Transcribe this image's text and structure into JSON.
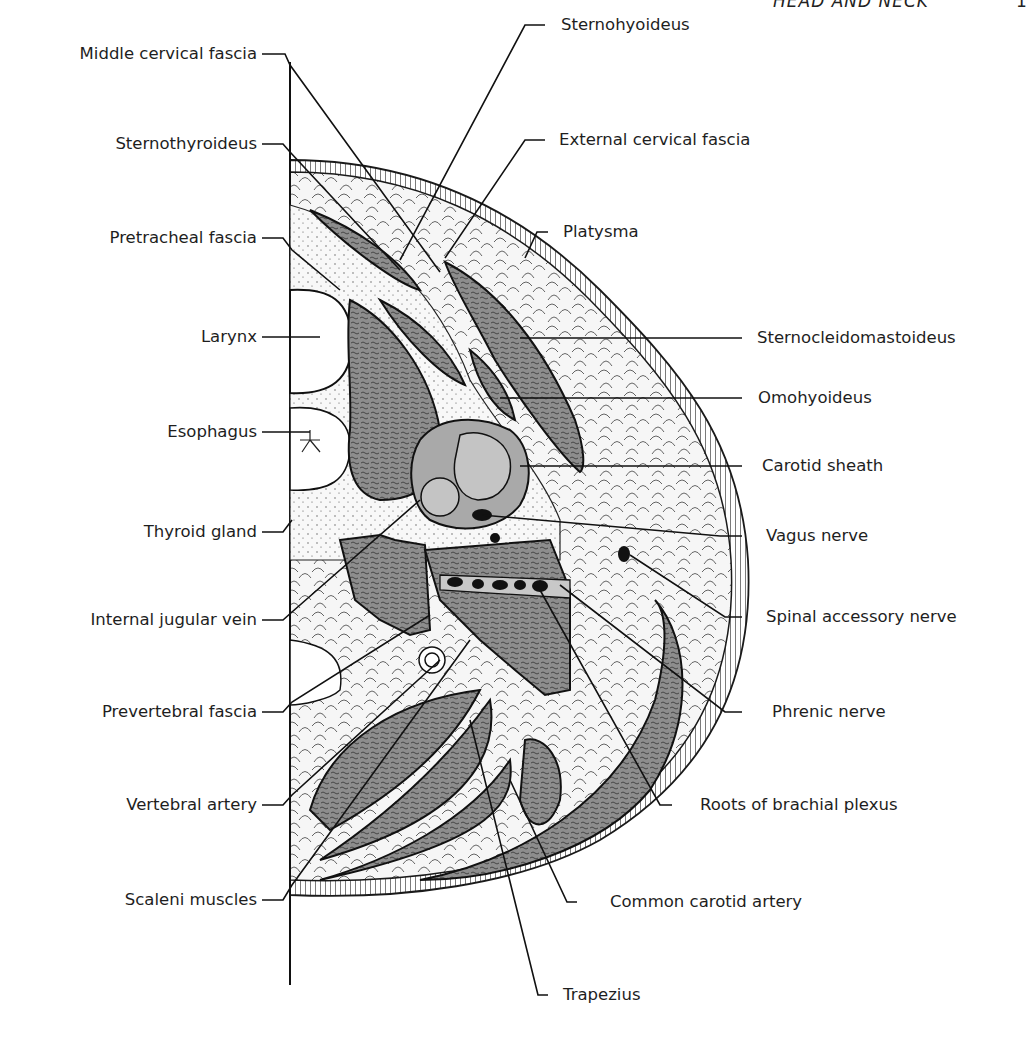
{
  "page": {
    "running_head": "HEAD AND NECK",
    "page_number": "1"
  },
  "figure": {
    "colors": {
      "muscle_fill": "#8d8d8d",
      "vessel_fill": "#a9a9a9",
      "fat_fill": "#f4f4f4",
      "skin_hatch": "#333333",
      "line": "#1a1a1a"
    },
    "labels_left": [
      {
        "id": "middle-cervical-fascia",
        "text": "Middle cervical fascia"
      },
      {
        "id": "sternothyroideus",
        "text": "Sternothyroideus"
      },
      {
        "id": "pretracheal-fascia",
        "text": "Pretracheal fascia"
      },
      {
        "id": "larynx",
        "text": "Larynx"
      },
      {
        "id": "esophagus",
        "text": "Esophagus"
      },
      {
        "id": "thyroid-gland",
        "text": "Thyroid gland"
      },
      {
        "id": "internal-jugular-vein",
        "text": "Internal jugular vein"
      },
      {
        "id": "prevertebral-fascia",
        "text": "Prevertebral fascia"
      },
      {
        "id": "vertebral-artery",
        "text": "Vertebral artery"
      },
      {
        "id": "scaleni-muscles",
        "text": "Scaleni muscles"
      }
    ],
    "labels_right": [
      {
        "id": "sternohyoideus",
        "text": "Sternohyoideus"
      },
      {
        "id": "external-cervical-fascia",
        "text": "External cervical fascia"
      },
      {
        "id": "platysma",
        "text": "Platysma"
      },
      {
        "id": "sternocleidomastoideus",
        "text": "Sternocleidomastoideus"
      },
      {
        "id": "omohyoideus",
        "text": "Omohyoideus"
      },
      {
        "id": "carotid-sheath",
        "text": "Carotid sheath"
      },
      {
        "id": "vagus-nerve",
        "text": "Vagus nerve"
      },
      {
        "id": "spinal-accessory-nerve",
        "text": "Spinal accessory nerve"
      },
      {
        "id": "phrenic-nerve",
        "text": "Phrenic nerve"
      },
      {
        "id": "roots-of-brachial-plexus",
        "text": "Roots of brachial plexus"
      },
      {
        "id": "common-carotid-artery",
        "text": "Common carotid artery"
      },
      {
        "id": "trapezius",
        "text": "Trapezius"
      }
    ]
  }
}
